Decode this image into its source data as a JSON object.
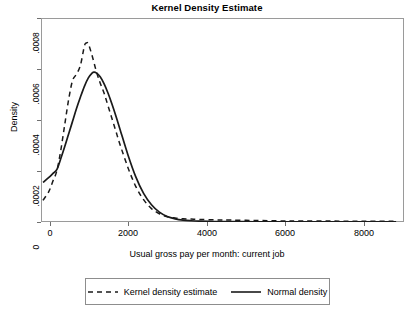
{
  "chart_data": {
    "type": "line",
    "title": "Kernel Density Estimate",
    "xlabel": "Usual gross pay per month: current job",
    "ylabel": "Density",
    "xlim": [
      -400,
      8800
    ],
    "ylim": [
      0,
      0.0008
    ],
    "grid": false,
    "legend_position": "bottom",
    "xticks": [
      0,
      2000,
      4000,
      6000,
      8000
    ],
    "xtick_labels": [
      "0",
      "2000",
      "4000",
      "6000",
      "8000"
    ],
    "yticks": [
      0,
      0.0002,
      0.0004,
      0.0006,
      0.0008
    ],
    "ytick_labels": [
      "0",
      ".0002",
      ".0004",
      ".0006",
      ".0008"
    ],
    "series": [
      {
        "name": "Kernel density estimate",
        "style": "dashed",
        "color": "#1a1a1a",
        "x": [
          -350,
          -200,
          -100,
          0,
          100,
          200,
          300,
          400,
          500,
          600,
          700,
          750,
          800,
          900,
          1000,
          1100,
          1200,
          1300,
          1400,
          1500,
          1600,
          1800,
          2000,
          2200,
          2400,
          2600,
          2800,
          3000,
          3200,
          3400,
          3600,
          4000,
          4400,
          5000,
          5600,
          6200,
          7000,
          7800,
          8600
        ],
        "y": [
          8.5e-05,
          0.00012,
          0.00016,
          0.0002,
          0.00028,
          0.00038,
          0.00048,
          0.000555,
          0.00058,
          0.000615,
          0.00069,
          0.000702,
          0.000698,
          0.00065,
          0.000592,
          0.000545,
          0.000505,
          0.000455,
          0.000405,
          0.000355,
          0.000305,
          0.000215,
          0.00014,
          8.75e-05,
          5.25e-05,
          3.25e-05,
          2.05e-05,
          1.55e-05,
          1.25e-05,
          1.15e-05,
          1e-05,
          8.5e-06,
          7.5e-06,
          6e-06,
          4.5e-06,
          4e-06,
          3.5e-06,
          3e-06,
          3e-06
        ]
      },
      {
        "name": "Normal density",
        "style": "solid",
        "color": "#1a1a1a",
        "x": [
          -350,
          -200,
          -100,
          0,
          100,
          200,
          300,
          400,
          500,
          600,
          700,
          800,
          900,
          950,
          1000,
          1100,
          1200,
          1300,
          1400,
          1500,
          1600,
          1800,
          2000,
          2200,
          2400,
          2600,
          2800,
          3000,
          3200,
          3400,
          3600,
          4000,
          4400,
          5000,
          5600,
          6200,
          7000,
          7800,
          8600
        ],
        "y": [
          0.000155,
          0.000175,
          0.00019,
          0.000205,
          0.000248,
          0.000295,
          0.000345,
          0.000395,
          0.000445,
          0.00049,
          0.000532,
          0.000565,
          0.000585,
          0.000588,
          0.000585,
          0.00057,
          0.000542,
          0.000505,
          0.000462,
          0.000415,
          0.000365,
          0.000265,
          0.000178,
          0.000112,
          6.75e-05,
          3.85e-05,
          2.15e-05,
          1.25e-05,
          7.5e-06,
          5e-06,
          3.5e-06,
          2e-06,
          1.5e-06,
          1e-06,
          1e-06,
          1e-06,
          1e-06,
          1e-06,
          1e-06
        ]
      }
    ],
    "legend_entries": [
      {
        "label": "Kernel density estimate",
        "style": "dashed"
      },
      {
        "label": "Normal density",
        "style": "solid"
      }
    ]
  },
  "axis": {
    "y_title": "Density",
    "x_title": "Usual gross pay per month: current job",
    "y_tick_0": "0",
    "y_tick_1": ".0002",
    "y_tick_2": ".0004",
    "y_tick_3": ".0006",
    "y_tick_4": ".0008",
    "x_tick_0": "0",
    "x_tick_1": "2000",
    "x_tick_2": "4000",
    "x_tick_3": "6000",
    "x_tick_4": "8000"
  },
  "header": {
    "title": "Kernel Density Estimate"
  },
  "legend": {
    "entry_0_label": "Kernel density estimate",
    "entry_1_label": "Normal density"
  },
  "colors": {
    "line": "#1a1a1a",
    "frame": "#9a9a9a",
    "background": "#ffffff"
  }
}
